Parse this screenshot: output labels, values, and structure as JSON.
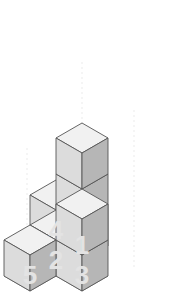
{
  "scene": {
    "kind": "isometric-block-figure",
    "background_color": "#ffffff",
    "projection": {
      "half_width": 26,
      "half_depth": 15,
      "cube_height": 36,
      "origin_x": 82,
      "origin_y": 231
    },
    "face_colors": {
      "top": "#f1f1f1",
      "left": "#dcdcdc",
      "right": "#b6b6b6",
      "edge": "#555555",
      "edge_width": 0.9
    },
    "cubes": [
      {
        "label": "column-1-base",
        "cell": 1,
        "level": 0
      },
      {
        "label": "column-1-mid",
        "cell": 1,
        "level": 1
      },
      {
        "label": "column-1-top",
        "cell": 1,
        "level": 2
      },
      {
        "label": "column-4-base",
        "cell": 4,
        "level": 0
      },
      {
        "label": "column-2-base",
        "cell": 2,
        "level": 0
      },
      {
        "label": "column-3-base",
        "cell": 3,
        "level": 0
      },
      {
        "label": "column-3-top",
        "cell": 3,
        "level": 1
      },
      {
        "label": "column-5-base",
        "cell": 5,
        "level": 0
      }
    ]
  },
  "grid": {
    "stroke_color": "#7a7a7a",
    "stroke_width": 0.8,
    "label_color": "#e3e3e3",
    "cells": [
      {
        "id": 4,
        "label": "4",
        "gx": -1,
        "gy": 0
      },
      {
        "id": 1,
        "label": "1",
        "gx": 0,
        "gy": 0
      },
      {
        "id": 2,
        "label": "2",
        "gx": 0,
        "gy": 1
      },
      {
        "id": 3,
        "label": "3",
        "gx": 1,
        "gy": 1
      },
      {
        "id": 5,
        "label": "5",
        "gx": 0,
        "gy": 2
      }
    ]
  },
  "guides": {
    "color": "#ebebeb",
    "dash": "2 3",
    "width": 1,
    "lines": [
      {
        "name": "guide-left",
        "x": 27,
        "y1": 148,
        "y2": 252
      },
      {
        "name": "guide-center",
        "x": 82,
        "y1": 62,
        "y2": 238
      },
      {
        "name": "guide-right",
        "x": 134,
        "y1": 110,
        "y2": 268
      }
    ]
  }
}
